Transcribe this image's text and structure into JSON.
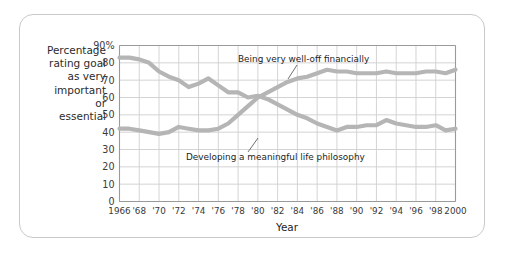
{
  "figure": {
    "border_color": "#c9c9c9",
    "background": "#ffffff"
  },
  "axis": {
    "y_caption_lines": [
      "Percentage",
      "rating goal",
      "as very",
      "important",
      "or",
      "essential"
    ],
    "x_title": "Year",
    "y_tick_labels": [
      "90%",
      "80",
      "70",
      "60",
      "50",
      "40",
      "30",
      "20",
      "10",
      "0"
    ],
    "x_tick_labels": [
      "1966",
      "'68",
      "'70",
      "'72",
      "'74",
      "'76",
      "'78",
      "'80",
      "'82",
      "'84",
      "'86",
      "'88",
      "'90",
      "'92",
      "'94",
      "'96",
      "'98",
      "2000"
    ]
  },
  "annotations": [
    {
      "label": "Being very well-off financially"
    },
    {
      "label": "Developing a meaningful life philosophy"
    }
  ],
  "chart_data": {
    "type": "line",
    "title": "",
    "subtitle": "",
    "xlabel": "Year",
    "ylabel": "Percentage rating goal as very important or essential",
    "xlim": [
      1966,
      2000
    ],
    "ylim": [
      0,
      90
    ],
    "ytick_step": 10,
    "xtick_step": 2,
    "grid": true,
    "legend_position": "inline-annotations",
    "line_color": "#b5b5b5",
    "line_width_px": 4.2,
    "x": [
      1966,
      1967,
      1968,
      1969,
      1970,
      1971,
      1972,
      1973,
      1974,
      1975,
      1976,
      1977,
      1978,
      1979,
      1980,
      1981,
      1982,
      1983,
      1984,
      1985,
      1986,
      1987,
      1988,
      1989,
      1990,
      1991,
      1992,
      1993,
      1994,
      1995,
      1996,
      1997,
      1998,
      1999,
      2000
    ],
    "series": [
      {
        "name": "Being very well-off financially",
        "values": [
          42,
          42,
          41,
          40,
          39,
          40,
          43,
          42,
          41,
          41,
          42,
          45,
          50,
          55,
          60,
          63,
          66,
          69,
          71,
          72,
          74,
          76,
          75,
          75,
          74,
          74,
          74,
          75,
          74,
          74,
          74,
          75,
          75,
          74,
          76
        ]
      },
      {
        "name": "Developing a meaningful life philosophy",
        "values": [
          83,
          83,
          82,
          80,
          75,
          72,
          70,
          66,
          68,
          71,
          67,
          63,
          63,
          60,
          61,
          59,
          56,
          53,
          50,
          48,
          45,
          43,
          41,
          43,
          43,
          44,
          44,
          47,
          45,
          44,
          43,
          43,
          44,
          41,
          42
        ]
      }
    ]
  }
}
